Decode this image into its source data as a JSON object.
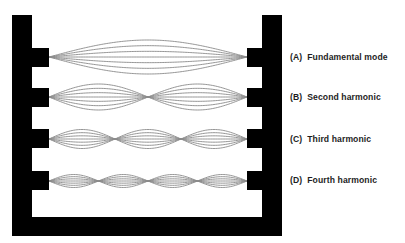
{
  "figure": {
    "frame": {
      "color": "#000000",
      "left_post": {
        "x": 12,
        "y": 15,
        "w": 20,
        "h": 221
      },
      "right_post": {
        "x": 262,
        "y": 15,
        "w": 20,
        "h": 221
      },
      "bottom_bar": {
        "x": 12,
        "y": 217,
        "w": 270,
        "h": 19
      },
      "tab_width": 17
    },
    "string_color": "#8a8a8a",
    "string_start_x": 49,
    "string_end_x": 247,
    "curves_per_mode": 7,
    "modes": [
      {
        "id": "A",
        "tag": "(A)",
        "name": "Fundamental mode",
        "loops": 1,
        "center_y": 57,
        "amplitude": 17,
        "tab_top": 48,
        "tab_h": 19,
        "label_y": 52
      },
      {
        "id": "B",
        "tag": "(B)",
        "name": "Second harmonic",
        "loops": 2,
        "center_y": 97,
        "amplitude": 13,
        "tab_top": 88,
        "tab_h": 19,
        "label_y": 92
      },
      {
        "id": "C",
        "tag": "(C)",
        "name": "Third harmonic",
        "loops": 3,
        "center_y": 139,
        "amplitude": 9.5,
        "tab_top": 129,
        "tab_h": 19,
        "label_y": 134
      },
      {
        "id": "D",
        "tag": "(D)",
        "name": "Fourth harmonic",
        "loops": 4,
        "center_y": 181,
        "amplitude": 6.5,
        "tab_top": 171,
        "tab_h": 19,
        "label_y": 175
      }
    ]
  }
}
